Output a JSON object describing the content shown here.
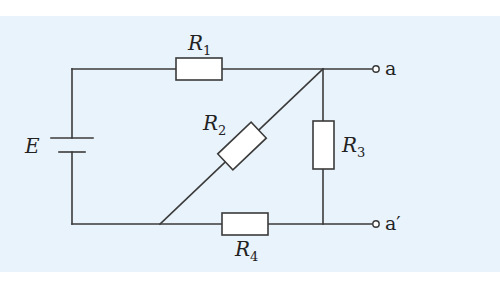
{
  "diagram": {
    "type": "circuit",
    "source": {
      "symbol": "E",
      "kind": "battery"
    },
    "resistors": [
      {
        "id": "R1",
        "symbol": "R",
        "subscript": "1",
        "between": [
          "left-top-corner",
          "junction-a"
        ]
      },
      {
        "id": "R2",
        "symbol": "R",
        "subscript": "2",
        "between": [
          "bottom-node",
          "junction-a"
        ],
        "orientation": "diagonal"
      },
      {
        "id": "R3",
        "symbol": "R",
        "subscript": "3",
        "between": [
          "junction-a",
          "junction-a-prime"
        ]
      },
      {
        "id": "R4",
        "symbol": "R",
        "subscript": "4",
        "between": [
          "bottom-node",
          "junction-a-prime"
        ]
      }
    ],
    "terminals": [
      {
        "id": "a",
        "label": "a"
      },
      {
        "id": "a-prime",
        "label": "a′"
      }
    ],
    "colors": {
      "background": "#e9f3fb",
      "wire": "#3a3a3a",
      "resistor_fill": "#ffffff"
    }
  }
}
